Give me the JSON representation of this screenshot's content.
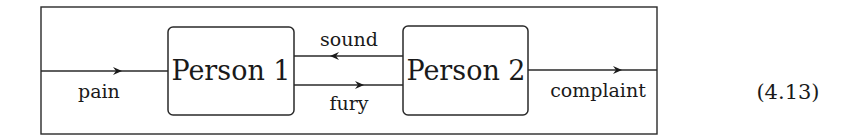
{
  "diagram": {
    "type": "block-diagram",
    "nodes": [
      {
        "id": "person1",
        "label": "Person 1"
      },
      {
        "id": "person2",
        "label": "Person 2"
      }
    ],
    "edges": [
      {
        "from": "input",
        "to": "person1",
        "label": "pain",
        "direction": "right"
      },
      {
        "from": "person2",
        "to": "person1",
        "label": "sound",
        "direction": "left"
      },
      {
        "from": "person1",
        "to": "person2",
        "label": "fury",
        "direction": "right"
      },
      {
        "from": "person2",
        "to": "output",
        "label": "complaint",
        "direction": "right"
      }
    ],
    "equation_number": "(4.13)",
    "colors": {
      "stroke": "#2a2a2a",
      "text": "#1a1a1a",
      "background": "#ffffff"
    }
  }
}
